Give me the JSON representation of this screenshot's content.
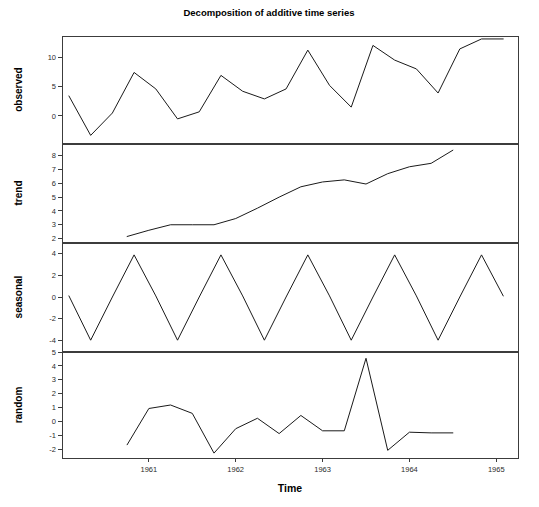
{
  "chart_data": {
    "type": "line",
    "title": "Decomposition of additive time series",
    "xlabel": "Time",
    "ylabel": "",
    "grid": false,
    "legend": "none",
    "xlim": [
      1960.0,
      1965.25
    ],
    "xticks": [
      1961,
      1962,
      1963,
      1964,
      1965
    ],
    "xticklabels": [
      "1961",
      "1962",
      "1963",
      "1964",
      "1965"
    ],
    "panels": [
      {
        "name": "observed",
        "ylabel": "observed",
        "ylim": [
          -4.6,
          13.6
        ],
        "yticks": [
          0,
          5,
          10
        ],
        "yticklabels": [
          "0",
          "5",
          "10"
        ],
        "x": [
          1960.08,
          1960.33,
          1960.58,
          1960.83,
          1961.08,
          1961.33,
          1961.58,
          1961.83,
          1962.08,
          1962.33,
          1962.58,
          1962.83,
          1963.08,
          1963.33,
          1963.58,
          1963.83,
          1964.08,
          1964.33,
          1964.58,
          1964.83,
          1965.08
        ],
        "y": [
          3.4,
          -3.3,
          0.5,
          7.4,
          4.6,
          -0.5,
          0.7,
          6.9,
          4.2,
          2.9,
          4.6,
          11.2,
          5.2,
          1.5,
          12.0,
          9.5,
          8.0,
          3.9,
          11.4,
          13.1,
          13.1
        ]
      },
      {
        "name": "trend",
        "ylabel": "trend",
        "ylim": [
          1.75,
          8.85
        ],
        "yticks": [
          2,
          3,
          4,
          5,
          6,
          7,
          8
        ],
        "yticklabels": [
          "2",
          "3",
          "4",
          "5",
          "6",
          "7",
          "8"
        ],
        "x": [
          1960.75,
          1961.0,
          1961.25,
          1961.5,
          1961.75,
          1962.0,
          1962.25,
          1962.5,
          1962.75,
          1963.0,
          1963.25,
          1963.5,
          1963.75,
          1964.0,
          1964.25,
          1964.5
        ],
        "y": [
          2.15,
          2.6,
          3.0,
          3.0,
          3.0,
          3.45,
          4.2,
          5.0,
          5.75,
          6.1,
          6.25,
          5.95,
          6.7,
          7.2,
          7.45,
          8.4
        ]
      },
      {
        "name": "seasonal",
        "ylabel": "seasonal",
        "ylim": [
          -5.0,
          5.0
        ],
        "yticks": [
          -4,
          -2,
          0,
          2,
          4
        ],
        "yticklabels": [
          "-4",
          "-2",
          "0",
          "2",
          "4"
        ],
        "x": [
          1960.08,
          1960.33,
          1960.58,
          1960.83,
          1961.08,
          1961.33,
          1961.58,
          1961.83,
          1962.08,
          1962.33,
          1962.58,
          1962.83,
          1963.08,
          1963.33,
          1963.58,
          1963.83,
          1964.08,
          1964.33,
          1964.58,
          1964.83,
          1965.08
        ],
        "y": [
          0.1,
          -4.0,
          0.0,
          3.9,
          0.1,
          -4.0,
          0.0,
          3.9,
          0.1,
          -4.0,
          0.0,
          3.9,
          0.1,
          -4.0,
          0.0,
          3.9,
          0.1,
          -4.0,
          0.0,
          3.9,
          0.1
        ]
      },
      {
        "name": "random",
        "ylabel": "random",
        "ylim": [
          -2.6,
          5.0
        ],
        "yticks": [
          -2,
          -1,
          0,
          1,
          2,
          3,
          4,
          5
        ],
        "yticklabels": [
          "-2",
          "-1",
          "0",
          "1",
          "2",
          "3",
          "4",
          "5"
        ],
        "x": [
          1960.75,
          1961.0,
          1961.25,
          1961.5,
          1961.75,
          1962.0,
          1962.25,
          1962.5,
          1962.75,
          1963.0,
          1963.25,
          1963.5,
          1963.75,
          1964.0,
          1964.25,
          1964.5
        ],
        "y": [
          -1.65,
          0.95,
          1.2,
          0.6,
          -2.25,
          -0.5,
          0.25,
          -0.85,
          0.45,
          -0.65,
          -0.65,
          4.55,
          -2.05,
          -0.75,
          -0.8,
          -0.8
        ]
      }
    ]
  },
  "layout": {
    "plot_left": 62,
    "plot_right": 518,
    "panel_tops": [
      36,
      144,
      243,
      352
    ],
    "panel_bottoms": [
      143,
      242,
      351,
      458
    ],
    "title_x": 269,
    "title_y": 16,
    "xlabel_x": 290,
    "xlabel_y": 492,
    "xaxis_y": 458,
    "tick_len": 4,
    "xtick_label_y": 472
  }
}
